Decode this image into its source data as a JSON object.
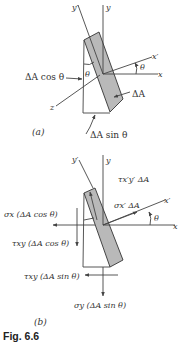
{
  "figure": {
    "caption": "Fig. 6.6",
    "panel_a": {
      "label": "(a)",
      "axes": {
        "y": "y",
        "y_prime": "y′",
        "x": "x",
        "x_prime": "x′",
        "z": "z"
      },
      "angle_labels": [
        "θ",
        "θ"
      ],
      "annotations": {
        "left_face": "ΔA cos θ",
        "inclined_face": "ΔA",
        "bottom_face": "ΔA sin θ"
      }
    },
    "panel_b": {
      "label": "(b)",
      "axes": {
        "y": "y",
        "y_prime": "y′",
        "x": "x",
        "x_prime": "x′"
      },
      "angle_label": "θ",
      "forces": {
        "tau_xy_prime": "τx′y′ ΔA",
        "sigma_x_prime": "σx′ ΔA",
        "sigma_x": "σx (ΔA cos θ)",
        "tau_xy_left": "τxy (ΔA cos θ)",
        "tau_xy_bottom": "τxy (ΔA sin θ)",
        "sigma_y": "σy (ΔA sin θ)"
      }
    }
  },
  "colors": {
    "slab": "#b9b9b9",
    "line": "#444444",
    "text": "#333333"
  }
}
